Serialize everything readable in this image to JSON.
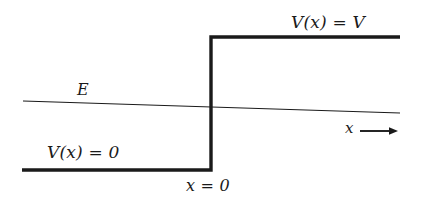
{
  "figure": {
    "kind": "potential-step-diagram",
    "background_color": "#ffffff",
    "stroke_color": "#1a1a1a",
    "labels": {
      "potential_high": "V(x) = V",
      "potential_zero": "V(x) = 0",
      "energy": "E",
      "origin": "x = 0",
      "axis": "x"
    },
    "icons": {
      "x_axis_arrow": "arrow-right-icon"
    }
  },
  "chart_data": {
    "type": "line",
    "title": "",
    "xlabel": "x",
    "ylabel": "",
    "grid": false,
    "legend": "none",
    "annotations": [
      {
        "text": "V(x) = V",
        "x": 291,
        "y": 27
      },
      {
        "text": "V(x) = 0",
        "x": 47,
        "y": 157
      },
      {
        "text": "E",
        "x": 77,
        "y": 95
      },
      {
        "text": "x = 0",
        "x": 186,
        "y": 192
      },
      {
        "text": "x",
        "x": 345,
        "y": 133
      }
    ],
    "series": [
      {
        "name": "V(x)",
        "style": "thick-step",
        "points": [
          {
            "x": 22,
            "y": 170
          },
          {
            "x": 211,
            "y": 170
          },
          {
            "x": 211,
            "y": 37
          },
          {
            "x": 400,
            "y": 37
          }
        ]
      },
      {
        "name": "E",
        "style": "thin-line",
        "points": [
          {
            "x": 23,
            "y": 101
          },
          {
            "x": 400,
            "y": 113
          }
        ]
      }
    ],
    "axis_arrow": {
      "name": "x",
      "from": {
        "x": 360,
        "y": 131
      },
      "to": {
        "x": 398,
        "y": 131
      }
    }
  }
}
